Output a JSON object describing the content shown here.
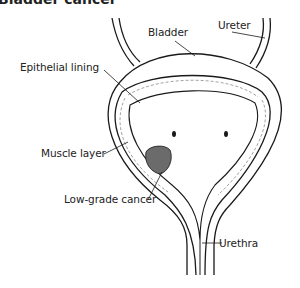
{
  "title": "Bladder cancer",
  "labels": {
    "bladder": "Bladder",
    "ureter": "Ureter",
    "epithelial": "Epithelial lining",
    "muscle": "Muscle layer",
    "cancer": "Low-grade cancer",
    "urethra": "Urethra"
  },
  "colors": {
    "line": "#1a1a1a",
    "tumor": "#6b6b6b",
    "texture": "#8a8a8a"
  }
}
